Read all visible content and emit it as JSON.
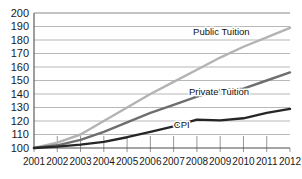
{
  "chart_data": {
    "type": "line",
    "title": "",
    "subtitle": "",
    "xlabel": "",
    "ylabel": "",
    "categories": [
      "2001",
      "2002",
      "2003",
      "2004",
      "2005",
      "2006",
      "2007",
      "2008",
      "2009",
      "2010",
      "2011",
      "2012"
    ],
    "x": [
      2001,
      2002,
      2003,
      2004,
      2005,
      2006,
      2007,
      2008,
      2009,
      2010,
      2011,
      2012
    ],
    "ylim": [
      100,
      200
    ],
    "xlim": [
      2001,
      2012
    ],
    "ytick_labels": [
      "200",
      "190",
      "180",
      "170",
      "160",
      "150",
      "140",
      "130",
      "120",
      "110",
      "100"
    ],
    "ytick_values": [
      200,
      190,
      180,
      170,
      160,
      150,
      140,
      130,
      120,
      110,
      100
    ],
    "grid": true,
    "grid_axis": "y",
    "legend": "inline-annotations",
    "series": [
      {
        "name": "Public Tuition",
        "color": "#b3b3b3",
        "width": 2.4,
        "label_x": 2009.05,
        "label_y": 184,
        "values": [
          100,
          104,
          110,
          120,
          130,
          140,
          149,
          158,
          167,
          175,
          182,
          189
        ]
      },
      {
        "name": "Private Tuition",
        "color": "#6e6e6e",
        "width": 2.4,
        "label_x": 2008.95,
        "label_y": 139,
        "values": [
          100,
          102,
          106,
          112,
          119,
          126,
          132,
          138,
          143,
          144,
          150,
          156
        ]
      },
      {
        "name": "CPI",
        "color": "#262626",
        "width": 2.4,
        "label_x": 2007.35,
        "label_y": 115,
        "values": [
          100,
          101,
          102.5,
          104.5,
          108,
          112,
          116,
          121,
          120.5,
          122,
          126,
          129
        ]
      }
    ],
    "annotations": [
      {
        "text": "Public Tuition",
        "series": "Public Tuition"
      },
      {
        "text": "Private Tuition",
        "series": "Private Tuition"
      },
      {
        "text": "CPI",
        "series": "CPI"
      }
    ]
  }
}
